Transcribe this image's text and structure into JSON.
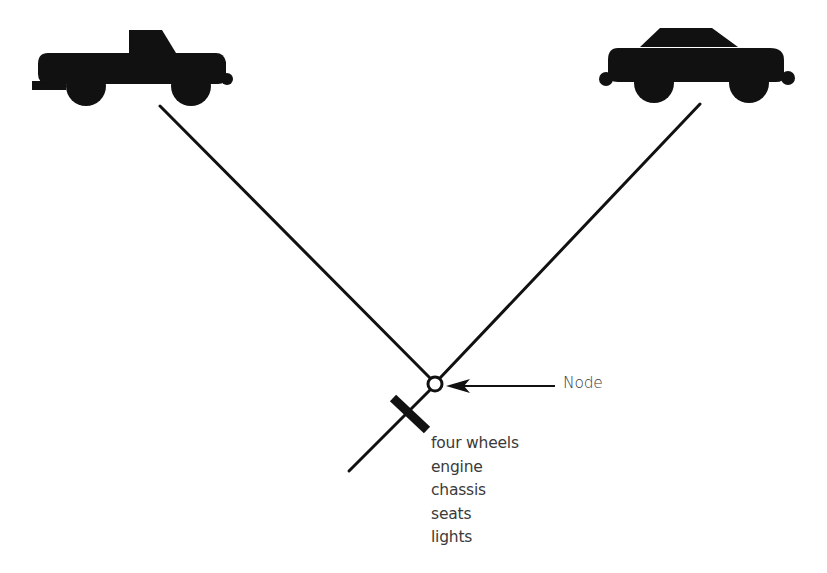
{
  "diagram": {
    "type": "cladogram",
    "taxa": [
      {
        "id": "pickup-truck",
        "icon": "pickup-truck-icon",
        "position": "top-left"
      },
      {
        "id": "sedan-car",
        "icon": "sedan-car-icon",
        "position": "top-right"
      }
    ],
    "node": {
      "label": "Node",
      "annotation": "arrow pointing to node"
    },
    "shared_characters": {
      "marker": "bar-across-stem",
      "items": [
        "four wheels",
        "engine",
        "chassis",
        "seats",
        "lights"
      ]
    },
    "colors": {
      "ink": "#111111",
      "text": "#3a3a3a",
      "background": "#ffffff"
    }
  }
}
